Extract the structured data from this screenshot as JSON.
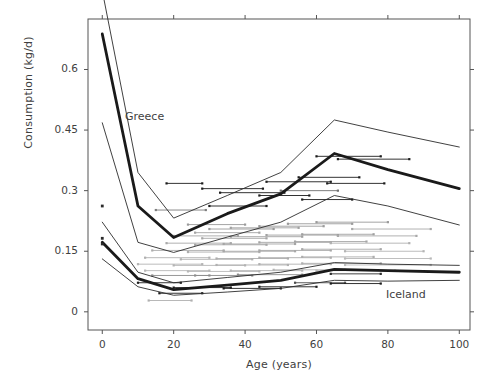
{
  "chart_data": {
    "type": "line",
    "title": "",
    "xlabel": "Age (years)",
    "ylabel": "Consumption (kg/d)",
    "xlim": [
      -4,
      103
    ],
    "ylim": [
      -0.045,
      0.725
    ],
    "xticks": [
      0,
      20,
      40,
      60,
      80,
      100
    ],
    "xticklabels": [
      "0",
      "20",
      "40",
      "60",
      "80",
      "100"
    ],
    "yticks": [
      0,
      0.15,
      0.3,
      0.45,
      0.6
    ],
    "yticklabels": [
      "0",
      "0.15",
      "0.3",
      "0.45",
      "0.6"
    ],
    "grid": false,
    "legend_position": "inline-annotations",
    "annotations": [
      {
        "text": "Greece",
        "x": 14,
        "y": 0.525
      },
      {
        "text": "Iceland",
        "x": 81,
        "y": 0.055
      }
    ],
    "x": [
      0,
      10,
      20,
      35,
      50,
      65,
      80,
      100
    ],
    "series": [
      {
        "name": "Greece upper bound",
        "style": "thin",
        "color": "#2b2b2b",
        "values": [
          0.795,
          0.345,
          0.232,
          0.288,
          0.345,
          0.475,
          0.445,
          0.408
        ]
      },
      {
        "name": "Greece mean",
        "style": "thick",
        "color": "#1a1a1a",
        "values": [
          0.688,
          0.262,
          0.184,
          0.243,
          0.292,
          0.392,
          0.352,
          0.305
        ]
      },
      {
        "name": "Greece lower bound",
        "style": "thin",
        "color": "#2b2b2b",
        "values": [
          0.468,
          0.172,
          0.147,
          0.185,
          0.222,
          0.288,
          0.262,
          0.215
        ]
      },
      {
        "name": "Iceland upper bound",
        "style": "thin",
        "color": "#2b2b2b",
        "values": [
          0.222,
          0.098,
          0.072,
          0.085,
          0.098,
          0.122,
          0.118,
          0.115
        ]
      },
      {
        "name": "Iceland mean",
        "style": "thick",
        "color": "#1a1a1a",
        "values": [
          0.172,
          0.082,
          0.055,
          0.066,
          0.078,
          0.105,
          0.102,
          0.098
        ]
      },
      {
        "name": "Iceland lower bound",
        "style": "thin",
        "color": "#2b2b2b",
        "values": [
          0.131,
          0.062,
          0.041,
          0.049,
          0.058,
          0.078,
          0.076,
          0.078
        ]
      }
    ],
    "scatter_points": [
      {
        "x": 0,
        "y": 0.262,
        "color": "#2b2b2b"
      },
      {
        "x": 0,
        "y": 0.182,
        "color": "#2b2b2b"
      },
      {
        "x": 0,
        "y": 0.168,
        "color": "#2b2b2b"
      }
    ],
    "interval_bars": [
      {
        "x0": 18,
        "x1": 28,
        "y": 0.318,
        "color": "#1c1c1c"
      },
      {
        "x0": 28,
        "x1": 45,
        "y": 0.305,
        "color": "#1c1c1c"
      },
      {
        "x0": 15,
        "x1": 29,
        "y": 0.252,
        "color": "#7d7d7d"
      },
      {
        "x0": 33,
        "x1": 51,
        "y": 0.295,
        "color": "#1c1c1c"
      },
      {
        "x0": 30,
        "x1": 46,
        "y": 0.262,
        "color": "#1c1c1c"
      },
      {
        "x0": 46,
        "x1": 64,
        "y": 0.322,
        "color": "#1c1c1c"
      },
      {
        "x0": 44,
        "x1": 58,
        "y": 0.288,
        "color": "#1c1c1c"
      },
      {
        "x0": 55,
        "x1": 72,
        "y": 0.333,
        "color": "#1c1c1c"
      },
      {
        "x0": 50,
        "x1": 66,
        "y": 0.3,
        "color": "#6f6f6f"
      },
      {
        "x0": 63,
        "x1": 79,
        "y": 0.318,
        "color": "#1c1c1c"
      },
      {
        "x0": 60,
        "x1": 78,
        "y": 0.385,
        "color": "#1c1c1c"
      },
      {
        "x0": 66,
        "x1": 86,
        "y": 0.378,
        "color": "#1c1c1c"
      },
      {
        "x0": 56,
        "x1": 70,
        "y": 0.278,
        "color": "#1c1c1c"
      },
      {
        "x0": 24,
        "x1": 40,
        "y": 0.216,
        "color": "#9a9a9a"
      },
      {
        "x0": 30,
        "x1": 48,
        "y": 0.205,
        "color": "#9a9a9a"
      },
      {
        "x0": 26,
        "x1": 44,
        "y": 0.196,
        "color": "#a5a5a5"
      },
      {
        "x0": 36,
        "x1": 55,
        "y": 0.208,
        "color": "#a0a0a0"
      },
      {
        "x0": 44,
        "x1": 62,
        "y": 0.212,
        "color": "#9a9a9a"
      },
      {
        "x0": 52,
        "x1": 70,
        "y": 0.218,
        "color": "#9a9a9a"
      },
      {
        "x0": 60,
        "x1": 80,
        "y": 0.222,
        "color": "#9a9a9a"
      },
      {
        "x0": 70,
        "x1": 92,
        "y": 0.205,
        "color": "#a8a8a8"
      },
      {
        "x0": 20,
        "x1": 38,
        "y": 0.188,
        "color": "#a5a5a5"
      },
      {
        "x0": 28,
        "x1": 46,
        "y": 0.182,
        "color": "#a5a5a5"
      },
      {
        "x0": 36,
        "x1": 56,
        "y": 0.186,
        "color": "#a0a0a0"
      },
      {
        "x0": 46,
        "x1": 66,
        "y": 0.19,
        "color": "#a0a0a0"
      },
      {
        "x0": 56,
        "x1": 76,
        "y": 0.192,
        "color": "#a0a0a0"
      },
      {
        "x0": 66,
        "x1": 88,
        "y": 0.188,
        "color": "#a8a8a8"
      },
      {
        "x0": 18,
        "x1": 36,
        "y": 0.17,
        "color": "#a8a8a8"
      },
      {
        "x0": 26,
        "x1": 46,
        "y": 0.166,
        "color": "#a8a8a8"
      },
      {
        "x0": 34,
        "x1": 54,
        "y": 0.168,
        "color": "#a5a5a5"
      },
      {
        "x0": 44,
        "x1": 64,
        "y": 0.172,
        "color": "#a5a5a5"
      },
      {
        "x0": 54,
        "x1": 74,
        "y": 0.174,
        "color": "#a5a5a5"
      },
      {
        "x0": 64,
        "x1": 86,
        "y": 0.17,
        "color": "#b0b0b0"
      },
      {
        "x0": 14,
        "x1": 34,
        "y": 0.152,
        "color": "#adadad"
      },
      {
        "x0": 24,
        "x1": 44,
        "y": 0.148,
        "color": "#adadad"
      },
      {
        "x0": 34,
        "x1": 54,
        "y": 0.15,
        "color": "#a8a8a8"
      },
      {
        "x0": 44,
        "x1": 64,
        "y": 0.152,
        "color": "#a8a8a8"
      },
      {
        "x0": 56,
        "x1": 78,
        "y": 0.155,
        "color": "#a8a8a8"
      },
      {
        "x0": 68,
        "x1": 90,
        "y": 0.15,
        "color": "#b4b4b4"
      },
      {
        "x0": 12,
        "x1": 30,
        "y": 0.134,
        "color": "#b0b0b0"
      },
      {
        "x0": 22,
        "x1": 42,
        "y": 0.13,
        "color": "#b0b0b0"
      },
      {
        "x0": 32,
        "x1": 52,
        "y": 0.132,
        "color": "#adadad"
      },
      {
        "x0": 44,
        "x1": 64,
        "y": 0.134,
        "color": "#adadad"
      },
      {
        "x0": 56,
        "x1": 76,
        "y": 0.136,
        "color": "#adadad"
      },
      {
        "x0": 68,
        "x1": 92,
        "y": 0.132,
        "color": "#b8b8b8"
      },
      {
        "x0": 10,
        "x1": 28,
        "y": 0.118,
        "color": "#b4b4b4"
      },
      {
        "x0": 20,
        "x1": 40,
        "y": 0.115,
        "color": "#b4b4b4"
      },
      {
        "x0": 32,
        "x1": 52,
        "y": 0.116,
        "color": "#b0b0b0"
      },
      {
        "x0": 44,
        "x1": 64,
        "y": 0.118,
        "color": "#b0b0b0"
      },
      {
        "x0": 56,
        "x1": 78,
        "y": 0.12,
        "color": "#b0b0b0"
      },
      {
        "x0": 68,
        "x1": 92,
        "y": 0.116,
        "color": "#bcbcbc"
      },
      {
        "x0": 12,
        "x1": 30,
        "y": 0.102,
        "color": "#b8b8b8"
      },
      {
        "x0": 24,
        "x1": 44,
        "y": 0.1,
        "color": "#b8b8b8"
      },
      {
        "x0": 36,
        "x1": 56,
        "y": 0.102,
        "color": "#b4b4b4"
      },
      {
        "x0": 48,
        "x1": 68,
        "y": 0.104,
        "color": "#b4b4b4"
      },
      {
        "x0": 60,
        "x1": 82,
        "y": 0.102,
        "color": "#bcbcbc"
      },
      {
        "x0": 14,
        "x1": 30,
        "y": 0.09,
        "color": "#8c8c8c"
      },
      {
        "x0": 26,
        "x1": 42,
        "y": 0.09,
        "color": "#8c8c8c"
      },
      {
        "x0": 38,
        "x1": 56,
        "y": 0.092,
        "color": "#8c8c8c"
      },
      {
        "x0": 64,
        "x1": 78,
        "y": 0.094,
        "color": "#2b2b2b"
      },
      {
        "x0": 20,
        "x1": 36,
        "y": 0.06,
        "color": "#1c1c1c"
      },
      {
        "x0": 34,
        "x1": 50,
        "y": 0.058,
        "color": "#1c1c1c"
      },
      {
        "x0": 16,
        "x1": 28,
        "y": 0.046,
        "color": "#1c1c1c"
      },
      {
        "x0": 13,
        "x1": 25,
        "y": 0.028,
        "color": "#b0b0b0"
      },
      {
        "x0": 44,
        "x1": 60,
        "y": 0.062,
        "color": "#1c1c1c"
      },
      {
        "x0": 54,
        "x1": 68,
        "y": 0.072,
        "color": "#4d4d4d"
      },
      {
        "x0": 64,
        "x1": 78,
        "y": 0.07,
        "color": "#1c1c1c"
      },
      {
        "x0": 10,
        "x1": 22,
        "y": 0.072,
        "color": "#1c1c1c"
      }
    ]
  }
}
